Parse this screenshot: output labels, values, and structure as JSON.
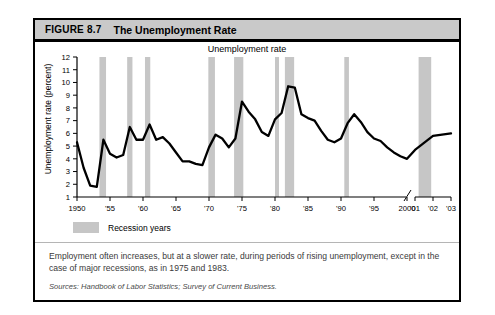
{
  "figure": {
    "number": "FIGURE 8.7",
    "title": "The Unemployment Rate"
  },
  "legend": {
    "label": "Recession years",
    "swatch_color": "#c6c6c6"
  },
  "caption": "Employment often increases, but at a slower rate, during periods of rising unemployment, except in the case of major recessions, as in 1975 and 1983.",
  "sources": "Sources: Handbook of Labor Statistics; Survey of Current Business.",
  "chart_data": {
    "type": "line",
    "title": "Unemployment rate",
    "xlabel": "",
    "ylabel": "Unemployment rate (percent)",
    "ylim": [
      1,
      12
    ],
    "ytick_labels": [
      "1",
      "2",
      "3",
      "4",
      "5",
      "6",
      "7",
      "8",
      "9",
      "10",
      "11",
      "12"
    ],
    "xtick_labels": [
      "1950",
      "'55",
      "'60",
      "'65",
      "'70",
      "'75",
      "'80",
      "'85",
      "'90",
      "'95",
      "2000",
      "'01",
      "'02",
      "'03"
    ],
    "xtick_years": [
      1950,
      1955,
      1960,
      1965,
      1970,
      1975,
      1980,
      1985,
      1990,
      1995,
      2000,
      2001,
      2002,
      2003
    ],
    "axis_break_after": 2000,
    "grid": false,
    "legend_position": "below-axis",
    "line_color": "#000000",
    "series": [
      {
        "name": "Unemployment rate",
        "x": [
          1950,
          1951,
          1952,
          1953,
          1954,
          1955,
          1956,
          1957,
          1958,
          1959,
          1960,
          1961,
          1962,
          1963,
          1964,
          1965,
          1966,
          1967,
          1968,
          1969,
          1970,
          1971,
          1972,
          1973,
          1974,
          1975,
          1976,
          1977,
          1978,
          1979,
          1980,
          1981,
          1982,
          1983,
          1984,
          1985,
          1986,
          1987,
          1988,
          1989,
          1990,
          1991,
          1992,
          1993,
          1994,
          1995,
          1996,
          1997,
          1998,
          1999,
          2000,
          2001,
          2002,
          2003
        ],
        "values": [
          5.3,
          3.3,
          1.9,
          1.8,
          5.5,
          4.4,
          4.1,
          4.3,
          6.5,
          5.5,
          5.5,
          6.7,
          5.5,
          5.7,
          5.2,
          4.5,
          3.8,
          3.8,
          3.6,
          3.5,
          4.9,
          5.9,
          5.6,
          4.9,
          5.6,
          8.5,
          7.7,
          7.1,
          6.1,
          5.8,
          7.1,
          7.6,
          9.7,
          9.6,
          7.5,
          7.2,
          7.0,
          6.2,
          5.5,
          5.3,
          5.6,
          6.8,
          7.5,
          6.9,
          6.1,
          5.6,
          5.4,
          4.9,
          4.5,
          4.2,
          4.0,
          4.7,
          5.8,
          6.0
        ]
      }
    ],
    "recession_bands": [
      {
        "start": 1953.4,
        "end": 1954.4
      },
      {
        "start": 1957.6,
        "end": 1958.4
      },
      {
        "start": 1960.3,
        "end": 1961.1
      },
      {
        "start": 1969.9,
        "end": 1970.9
      },
      {
        "start": 1973.8,
        "end": 1975.2
      },
      {
        "start": 1980.0,
        "end": 1980.6
      },
      {
        "start": 1981.5,
        "end": 1982.9
      },
      {
        "start": 1990.5,
        "end": 1991.2
      },
      {
        "start": 2001.2,
        "end": 2001.9
      }
    ]
  }
}
